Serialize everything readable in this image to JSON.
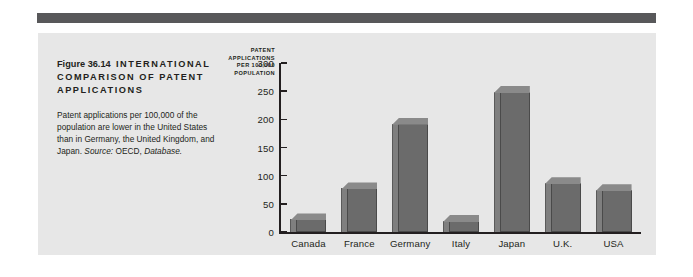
{
  "figure": {
    "number_label": "Figure 36.14",
    "title": "INTERNATIONAL COMPARISON OF PATENT APPLICATIONS",
    "caption_main": "Patent applications per 100,000 of the population are lower in the United States than in Germany, the United Kingdom, and Japan.",
    "source_label": "Source:",
    "source_name": "OECD,",
    "source_publication": "Database."
  },
  "colors": {
    "panel_background": "#e7e7e7",
    "rule": "#58585a",
    "bar_face": "#6b6b6b",
    "bar_side": "#7f7f7f",
    "bar_top": "#8a8a8a",
    "axis": "#231f20",
    "text": "#231f20"
  },
  "chart_data": {
    "type": "bar",
    "title": "INTERNATIONAL COMPARISON OF PATENT APPLICATIONS",
    "categories": [
      "Canada",
      "France",
      "Germany",
      "Italy",
      "Japan",
      "U.K.",
      "USA"
    ],
    "values": [
      33,
      88,
      203,
      30,
      259,
      97,
      85
    ],
    "xlabel": "",
    "ylabel": "PATENT APPLICATIONS PER 100,000 POPULATION",
    "ylabel_lines": [
      "PATENT",
      "APPLICATIONS",
      "PER 100,000",
      "POPULATION"
    ],
    "ylim": [
      0,
      300
    ],
    "yticks": [
      0,
      50,
      100,
      150,
      200,
      250,
      300
    ],
    "ytick_labels": [
      "0",
      "50",
      "100",
      "150",
      "200",
      "250",
      "300"
    ],
    "grid": false,
    "legend": null
  }
}
